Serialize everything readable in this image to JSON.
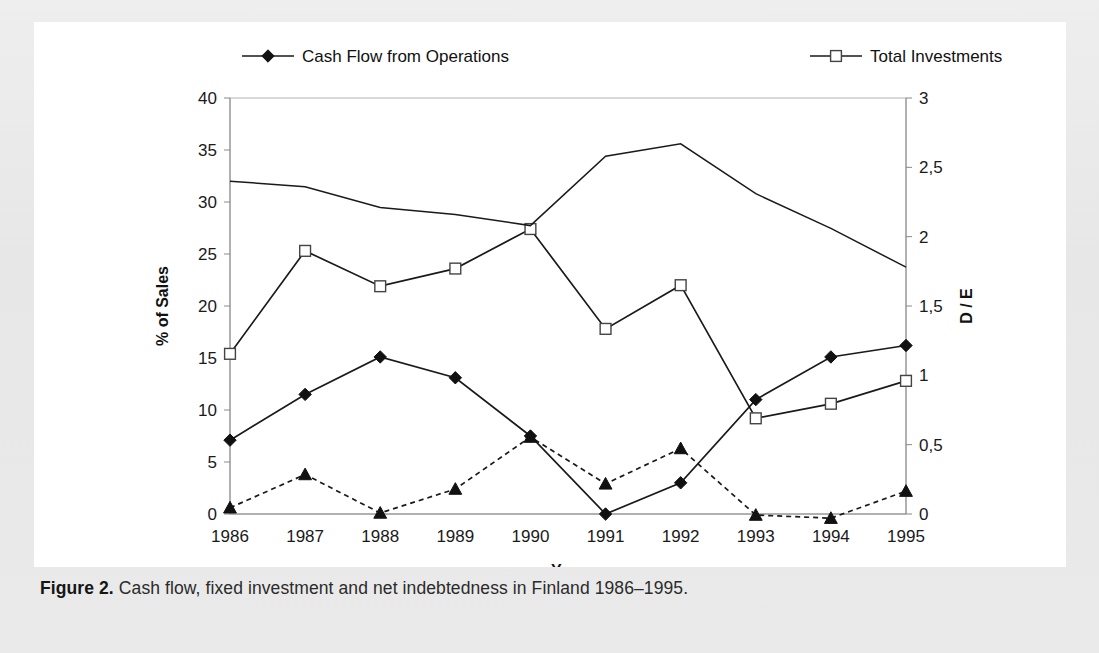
{
  "caption": {
    "label": "Figure 2.",
    "text": " Cash flow, fixed investment and net indebtedness in Finland 1986–1995."
  },
  "chart_data": {
    "type": "line",
    "title": "",
    "xlabel": "Year",
    "ylabel": "% of Sales",
    "y2label": "D / E",
    "categories": [
      "1986",
      "1987",
      "1988",
      "1989",
      "1990",
      "1991",
      "1992",
      "1993",
      "1994",
      "1995"
    ],
    "ylim": [
      0,
      40
    ],
    "y2lim": [
      0,
      3
    ],
    "yticks": [
      "0",
      "5",
      "10",
      "15",
      "20",
      "25",
      "30",
      "35",
      "40"
    ],
    "ytick_values": [
      0,
      5,
      10,
      15,
      20,
      25,
      30,
      35,
      40
    ],
    "y2ticks": [
      "0",
      "0,5",
      "1",
      "1,5",
      "2",
      "2,5",
      "3"
    ],
    "y2tick_values": [
      0,
      0.5,
      1,
      1.5,
      2,
      2.5,
      3
    ],
    "grid": false,
    "legend_position": "top",
    "series": [
      {
        "name": "Cash Flow from Operations",
        "axis": "left",
        "marker": "diamond-filled",
        "linestyle": "solid",
        "values": [
          7.1,
          11.5,
          15.1,
          13.1,
          7.5,
          0.0,
          3.0,
          11.0,
          15.1,
          16.2
        ]
      },
      {
        "name": "Total Investments",
        "axis": "left",
        "marker": "square-open",
        "linestyle": "solid",
        "values": [
          15.4,
          25.3,
          21.9,
          23.6,
          27.4,
          17.8,
          22.0,
          9.2,
          10.6,
          12.8
        ]
      },
      {
        "name": "M&A's",
        "axis": "left",
        "marker": "triangle-filled",
        "linestyle": "dashed",
        "values": [
          0.6,
          3.8,
          0.1,
          2.4,
          7.4,
          2.9,
          6.3,
          -0.1,
          -0.4,
          2.2
        ]
      },
      {
        "name": "D/E",
        "axis": "right",
        "marker": "none",
        "linestyle": "solid",
        "values": [
          2.4,
          2.36,
          2.21,
          2.16,
          2.08,
          2.58,
          2.67,
          2.31,
          2.06,
          1.78
        ]
      }
    ]
  },
  "legend": [
    {
      "label": "Cash Flow from Operations",
      "marker": "diamond-filled",
      "linestyle": "solid"
    },
    {
      "label": "Total Investments",
      "marker": "square-open",
      "linestyle": "solid"
    },
    {
      "label": "M&A's",
      "marker": "triangle-filled",
      "linestyle": "dashed"
    },
    {
      "label": "D/E",
      "marker": "none",
      "linestyle": "solid"
    }
  ],
  "colors": {
    "ink": "#111111",
    "axis": "#888888",
    "frame": "#b4b4b4",
    "panel_bg": "#ffffff",
    "page_bg": "#e9e9e9"
  }
}
